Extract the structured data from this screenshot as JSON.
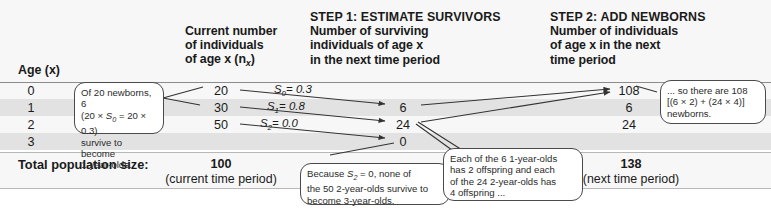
{
  "figure": {
    "columns": {
      "age": "Age (x)",
      "current": {
        "line1": "Current number",
        "line2": "of individuals",
        "line3": "of age x (n",
        "sub": "x",
        "line3_end": ")"
      },
      "step1": {
        "step": "STEP 1: ESTIMATE SURVIVORS",
        "line1": "Number of surviving",
        "line2": "individuals of age x",
        "line3": "in the next time period"
      },
      "step2": {
        "step": "STEP 2: ADD NEWBORNS",
        "line1": "Number of individuals",
        "line2": "of age x in the next",
        "line3": "time period"
      }
    },
    "rows": [
      {
        "age": "0",
        "current": "20",
        "survival_label": "S",
        "survival_sub": "0",
        "survival_value": "= 0.3",
        "survivors": "6",
        "next": "108"
      },
      {
        "age": "1",
        "current": "30",
        "survival_label": "S",
        "survival_sub": "1",
        "survival_value": "= 0.8",
        "survivors": "24",
        "next": "6"
      },
      {
        "age": "2",
        "current": "50",
        "survival_label": "S",
        "survival_sub": "2",
        "survival_value": "= 0.0",
        "survivors": "0",
        "next": "24"
      },
      {
        "age": "3",
        "current": "",
        "survival_label": "",
        "survival_sub": "",
        "survival_value": "",
        "survivors": "",
        "next": ""
      }
    ],
    "totals": {
      "label": "Total population size:",
      "current_value": "100",
      "current_note": "(current time period)",
      "next_value": "138",
      "next_note": "(next time period)"
    },
    "callouts": {
      "newborn_survival": {
        "l1a": "Of 20 newborns, 6",
        "l2a": "(20 × ",
        "l2b": "S",
        "l2sub": "0",
        "l2c": " = 20 × 0.3)",
        "l3": "survive to become",
        "l4": "1-year-olds."
      },
      "no_survivors": {
        "l1a": "Because ",
        "l1b": "S",
        "l1sub": "2",
        "l1c": " = 0, none of",
        "l2": "the 50 2-year-olds survive to",
        "l3": "become 3-year-olds."
      },
      "offspring": {
        "l1": "Each of the 6 1-year-olds",
        "l2": "has 2 offspring and each",
        "l3": "of the 24 2-year-olds has",
        "l4": "4 offspring ..."
      },
      "newborn_total": {
        "l1": "... so there are 108",
        "l2": "[(6 × 2) + (24 × 4)]",
        "l3": "newborns."
      }
    },
    "colors": {
      "band": "#e2e2e2",
      "band_light": "#f7f7f7",
      "rule": "#8c8c8c",
      "text": "#1a1a1a",
      "callout_border": "#4a4a4a",
      "arrow": "#333333"
    }
  }
}
